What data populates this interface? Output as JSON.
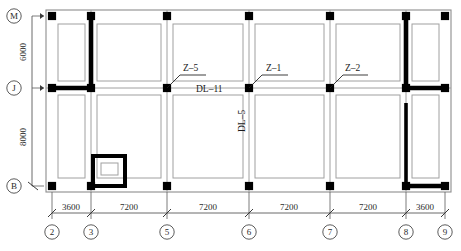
{
  "drawing": {
    "title": "Structural foundation / column layout plan",
    "colors": {
      "column_fill": "#000000",
      "wall": "#000000",
      "outline": "#7a7a7a",
      "inner_room": "#9a9a9a",
      "dimension": "#5a5a5a",
      "text": "#1a1a1a",
      "background": "#ffffff"
    }
  },
  "vertical_axis": {
    "labels": [
      {
        "id": "M",
        "text": "M",
        "y": 16
      },
      {
        "id": "J",
        "text": "J",
        "y": 88
      },
      {
        "id": "B",
        "text": "B",
        "y": 186
      }
    ],
    "dimensions": [
      {
        "text": "6000",
        "from": "M",
        "to": "J",
        "y": 52
      },
      {
        "text": "8000",
        "from": "J",
        "to": "B",
        "y": 137
      }
    ]
  },
  "horizontal_axis": {
    "labels": [
      {
        "id": "2",
        "text": "2",
        "x": 52
      },
      {
        "id": "3",
        "text": "3",
        "x": 91
      },
      {
        "id": "5",
        "text": "5",
        "x": 167
      },
      {
        "id": "6",
        "text": "6",
        "x": 249
      },
      {
        "id": "7",
        "text": "7",
        "x": 330
      },
      {
        "id": "8",
        "text": "8",
        "x": 406
      },
      {
        "id": "9",
        "text": "9",
        "x": 445
      }
    ],
    "dimensions": [
      {
        "text": "3600",
        "from": "2",
        "to": "3",
        "x": 71
      },
      {
        "text": "7200",
        "from": "3",
        "to": "5",
        "x": 129
      },
      {
        "text": "7200",
        "from": "5",
        "to": "6",
        "x": 208
      },
      {
        "text": "7200",
        "from": "6",
        "to": "7",
        "x": 289
      },
      {
        "text": "7200",
        "from": "7",
        "to": "8",
        "x": 368
      },
      {
        "text": "3600",
        "from": "8",
        "to": "9",
        "x": 425
      }
    ]
  },
  "annotations": [
    {
      "id": "z5",
      "text": "Z–5",
      "x": 189,
      "y": 61,
      "leader_to_x": 167,
      "leader_to_y": 88
    },
    {
      "id": "z1",
      "text": "Z–1",
      "x": 271,
      "y": 61,
      "leader_to_x": 249,
      "leader_to_y": 88
    },
    {
      "id": "z2",
      "text": "Z–2",
      "x": 350,
      "y": 61,
      "leader_to_x": 330,
      "leader_to_y": 88
    },
    {
      "id": "dl11",
      "text": "DL–11",
      "x": 210,
      "y": 88,
      "orientation": "horizontal"
    },
    {
      "id": "dl5",
      "text": "DL–5",
      "x": 249,
      "y": 122,
      "orientation": "vertical"
    }
  ],
  "columns": [
    {
      "row": "M",
      "grid": "2",
      "x": 52,
      "y": 16
    },
    {
      "row": "M",
      "grid": "3",
      "x": 91,
      "y": 16
    },
    {
      "row": "M",
      "grid": "5",
      "x": 167,
      "y": 16
    },
    {
      "row": "M",
      "grid": "6",
      "x": 249,
      "y": 16
    },
    {
      "row": "M",
      "grid": "7",
      "x": 330,
      "y": 16
    },
    {
      "row": "M",
      "grid": "8",
      "x": 406,
      "y": 16
    },
    {
      "row": "M",
      "grid": "9",
      "x": 445,
      "y": 16
    },
    {
      "row": "J",
      "grid": "2",
      "x": 52,
      "y": 88
    },
    {
      "row": "J",
      "grid": "3",
      "x": 91,
      "y": 88
    },
    {
      "row": "J",
      "grid": "5",
      "x": 167,
      "y": 88
    },
    {
      "row": "J",
      "grid": "6",
      "x": 249,
      "y": 88
    },
    {
      "row": "J",
      "grid": "7",
      "x": 330,
      "y": 88
    },
    {
      "row": "J",
      "grid": "8",
      "x": 406,
      "y": 88
    },
    {
      "row": "J",
      "grid": "9",
      "x": 445,
      "y": 88
    },
    {
      "row": "B",
      "grid": "2",
      "x": 52,
      "y": 186
    },
    {
      "row": "B",
      "grid": "3",
      "x": 91,
      "y": 186
    },
    {
      "row": "B",
      "grid": "5",
      "x": 167,
      "y": 186
    },
    {
      "row": "B",
      "grid": "6",
      "x": 249,
      "y": 186
    },
    {
      "row": "B",
      "grid": "7",
      "x": 330,
      "y": 186
    },
    {
      "row": "B",
      "grid": "8",
      "x": 406,
      "y": 186
    },
    {
      "row": "B",
      "grid": "9",
      "x": 445,
      "y": 186
    }
  ]
}
